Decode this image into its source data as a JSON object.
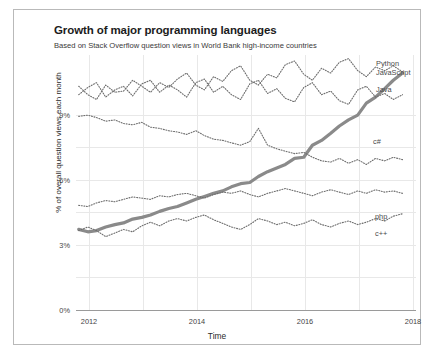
{
  "chart_data": {
    "type": "line",
    "title": "Growth of major programming languages",
    "subtitle": "Based on Stack Overflow question views in World Bank high-income countries",
    "xlabel": "Time",
    "ylabel": "% of overall question views each month",
    "xlim": [
      2011.7,
      2018.0
    ],
    "ylim": [
      0,
      10.6
    ],
    "xticks": [
      2012,
      2014,
      2016,
      2018
    ],
    "xticklabels": [
      "2012",
      "2014",
      "2016",
      "2018"
    ],
    "yticks": [
      0,
      3,
      6,
      9
    ],
    "yticklabels": [
      "0%",
      "3%",
      "6%",
      "9%"
    ],
    "grid": true,
    "legend_position": "right-inline-labels",
    "highlight_series": "Python",
    "highlight_color": "#8a8a8a",
    "dotted_color": "#6e6e6e",
    "x": [
      2011.75,
      2011.92,
      2012.08,
      2012.25,
      2012.42,
      2012.58,
      2012.75,
      2012.92,
      2013.08,
      2013.25,
      2013.42,
      2013.58,
      2013.75,
      2013.92,
      2014.08,
      2014.25,
      2014.42,
      2014.58,
      2014.75,
      2014.92,
      2015.08,
      2015.25,
      2015.42,
      2015.58,
      2015.75,
      2015.92,
      2016.08,
      2016.25,
      2016.42,
      2016.58,
      2016.75,
      2016.92,
      2017.08,
      2017.25,
      2017.42,
      2017.58,
      2017.75
    ],
    "series": [
      {
        "name": "Python",
        "style": "solid-thick",
        "label_x": 2017.95,
        "values": [
          3.35,
          3.25,
          3.3,
          3.45,
          3.55,
          3.62,
          3.78,
          3.85,
          3.95,
          4.1,
          4.22,
          4.3,
          4.45,
          4.6,
          4.72,
          4.85,
          4.95,
          5.12,
          5.25,
          5.3,
          5.55,
          5.75,
          5.9,
          6.05,
          6.3,
          6.35,
          6.85,
          7.05,
          7.35,
          7.65,
          7.9,
          8.1,
          8.6,
          8.85,
          9.2,
          9.55,
          9.85
        ]
      },
      {
        "name": "JavaScript",
        "style": "dotted",
        "label_x": 2017.95,
        "values": [
          9.3,
          8.95,
          8.75,
          9.35,
          9.05,
          9.1,
          9.55,
          9.3,
          9.05,
          9.45,
          9.25,
          9.6,
          9.85,
          9.35,
          9.15,
          9.7,
          9.5,
          9.95,
          10.15,
          9.55,
          9.35,
          9.8,
          9.65,
          10.2,
          10.35,
          9.8,
          9.55,
          10.05,
          9.85,
          10.3,
          10.45,
          9.95,
          9.7,
          10.1,
          9.95,
          10.15,
          9.9
        ]
      },
      {
        "name": "Java",
        "style": "dotted",
        "label_x": 2017.95,
        "values": [
          8.95,
          9.25,
          9.45,
          8.85,
          9.15,
          9.3,
          8.9,
          9.4,
          9.55,
          9.05,
          9.35,
          9.15,
          8.85,
          9.45,
          9.6,
          9.05,
          9.3,
          8.95,
          8.75,
          9.4,
          9.55,
          9.0,
          9.2,
          8.8,
          8.65,
          9.25,
          9.45,
          8.95,
          9.1,
          8.7,
          8.55,
          9.15,
          9.3,
          8.85,
          9.0,
          8.75,
          8.95
        ]
      },
      {
        "name": "c#",
        "style": "dotted",
        "label_x": 2017.95,
        "values": [
          8.05,
          8.1,
          8.0,
          7.85,
          7.9,
          7.75,
          7.7,
          7.8,
          7.6,
          7.55,
          7.45,
          7.4,
          7.3,
          7.45,
          7.25,
          7.1,
          7.05,
          6.95,
          6.85,
          7.0,
          7.55,
          6.85,
          6.7,
          6.6,
          6.5,
          6.55,
          6.35,
          6.2,
          6.15,
          6.3,
          6.1,
          6.25,
          6.05,
          6.3,
          6.2,
          6.35,
          6.25
        ]
      },
      {
        "name": "php",
        "style": "dotted",
        "label_x": 2017.95,
        "values": [
          4.35,
          4.3,
          4.45,
          4.55,
          4.5,
          4.6,
          4.7,
          4.65,
          4.6,
          4.75,
          4.7,
          4.8,
          4.85,
          4.75,
          4.65,
          4.8,
          4.9,
          4.85,
          4.95,
          4.8,
          4.7,
          4.85,
          4.95,
          5.05,
          4.95,
          4.85,
          4.75,
          4.9,
          5.0,
          4.9,
          4.8,
          4.95,
          4.85,
          5.0,
          4.9,
          4.95,
          4.85
        ]
      },
      {
        "name": "c++",
        "style": "dotted",
        "label_x": 2017.95,
        "values": [
          3.3,
          3.45,
          3.3,
          3.05,
          3.2,
          3.35,
          3.25,
          3.5,
          3.65,
          3.5,
          3.7,
          3.8,
          3.7,
          3.85,
          3.95,
          3.75,
          3.6,
          3.45,
          3.35,
          3.55,
          3.8,
          3.7,
          3.55,
          3.65,
          3.5,
          3.6,
          3.75,
          3.55,
          3.45,
          3.6,
          3.7,
          3.55,
          3.65,
          3.8,
          3.7,
          3.9,
          4.0
        ]
      }
    ]
  }
}
